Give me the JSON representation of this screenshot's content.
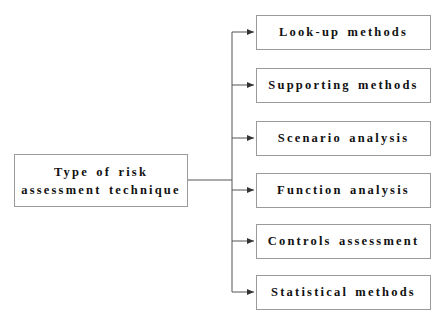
{
  "diagram": {
    "root": {
      "line1": "Type of risk",
      "line2": "assessment technique"
    },
    "children": [
      {
        "label": "Look-up methods"
      },
      {
        "label": "Supporting methods"
      },
      {
        "label": "Scenario analysis"
      },
      {
        "label": "Function analysis"
      },
      {
        "label": "Controls assessment"
      },
      {
        "label": "Statistical methods"
      }
    ],
    "colors": {
      "line": "#555555",
      "border": "#9a9a9a",
      "text": "#111111"
    }
  }
}
